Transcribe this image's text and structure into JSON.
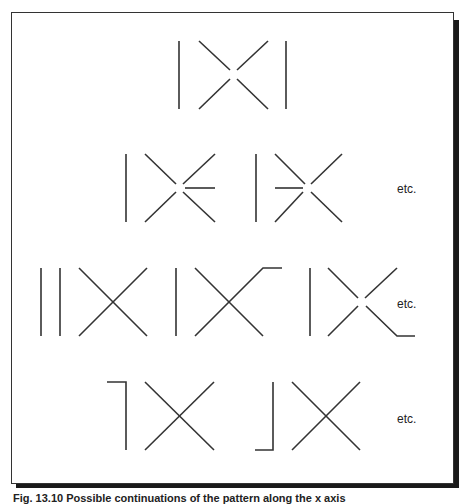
{
  "figure": {
    "etc_labels": [
      "etc.",
      "etc.",
      "etc."
    ],
    "caption": "Fig. 13.10 Possible continuations of the pattern along the x axis",
    "stroke_color": "#333333",
    "frame_color": "#333333",
    "shadow_color": "#1a1a1a",
    "rows": [
      {
        "id": "row-1",
        "description": "two verticals with broken X between"
      },
      {
        "id": "row-2",
        "description": "vertical + broken X with horizontal spur (right / left)"
      },
      {
        "id": "row-3",
        "description": "double vertical + X; vertical + X with top-right tail; vertical + broken X with bottom-right tail"
      },
      {
        "id": "row-4",
        "description": "hooked vertical (top) + X; hooked vertical (bottom) + X"
      }
    ]
  }
}
